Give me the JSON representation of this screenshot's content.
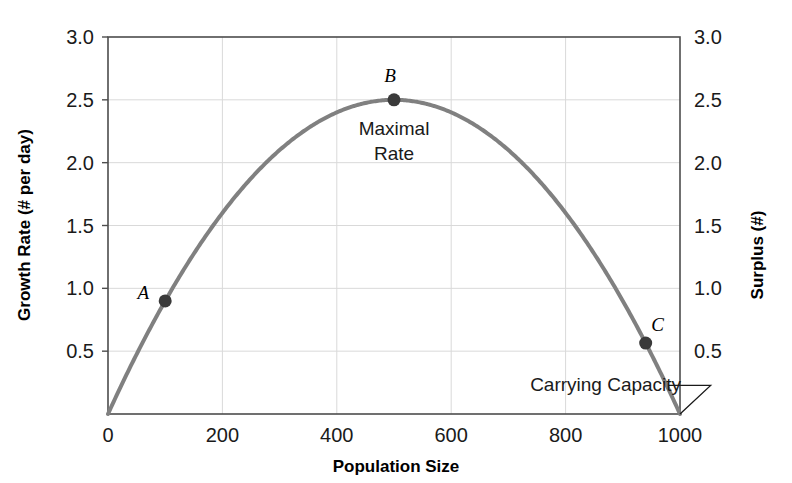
{
  "chart_data": {
    "type": "line",
    "title": "",
    "subtitle": "",
    "xlabel": "Population Size",
    "ylabel": "Growth Rate (# per day)",
    "y2label": "Surplus (#)",
    "xlim": [
      0,
      1000
    ],
    "ylim": [
      0,
      3.0
    ],
    "xticks": [
      0,
      200,
      400,
      600,
      800,
      1000
    ],
    "xtick_labels": [
      "0",
      "200",
      "400",
      "600",
      "800",
      "1000"
    ],
    "yticks": [
      0.5,
      1.0,
      1.5,
      2.0,
      2.5,
      3.0
    ],
    "ytick_labels": [
      "0.5",
      "1.0",
      "1.5",
      "2.0",
      "2.5",
      "3.0"
    ],
    "y2ticks": [
      0.5,
      1.0,
      1.5,
      2.0,
      2.5,
      3.0
    ],
    "y2tick_labels": [
      "0.5",
      "1.0",
      "1.5",
      "2.0",
      "2.5",
      "3.0"
    ],
    "grid": true,
    "grid_color": "#d9d9d9",
    "legend": null,
    "series": [
      {
        "name": "logistic-growth-rate",
        "color": "#808080",
        "line_width": 4,
        "equation": "y = 0.01 * x * (1 - x/1000)",
        "x": [
          0,
          50,
          100,
          150,
          200,
          250,
          300,
          350,
          400,
          450,
          500,
          550,
          600,
          650,
          700,
          750,
          800,
          850,
          900,
          950,
          1000
        ],
        "values": [
          0.0,
          0.475,
          0.9,
          1.275,
          1.6,
          1.875,
          2.1,
          2.275,
          2.4,
          2.475,
          2.5,
          2.475,
          2.4,
          2.275,
          2.1,
          1.875,
          1.6,
          1.275,
          0.9,
          0.475,
          0.0
        ]
      }
    ],
    "points": [
      {
        "label": "A",
        "x": 100,
        "y": 0.9,
        "label_dx": -22,
        "label_dy": -2
      },
      {
        "label": "B",
        "x": 500,
        "y": 2.5,
        "label_dx": -4,
        "label_dy": -18
      },
      {
        "label": "C",
        "x": 940,
        "y": 0.564,
        "label_dx": 12,
        "label_dy": -12
      }
    ],
    "annotations": [
      {
        "name": "maximal-rate",
        "text_line1": "Maximal",
        "text_line2": "Rate",
        "x": 500,
        "y": 2.22
      },
      {
        "name": "carrying-capacity",
        "text": "Carrying Capacity",
        "x": 870,
        "y": 0.18,
        "target_x": 1000,
        "target_y": 0.0
      }
    ],
    "colors": {
      "curve": "#808080",
      "point": "#3a3a3a",
      "axis": "#4d4d4d",
      "text": "#1a1a1a",
      "grid": "#d9d9d9",
      "background": "#ffffff"
    }
  }
}
